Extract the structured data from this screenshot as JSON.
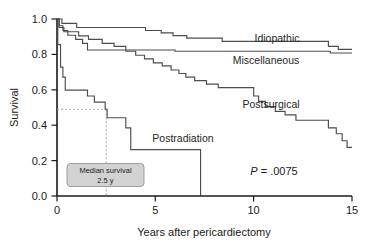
{
  "figure": {
    "background_color": "#ffffff",
    "curve_color": "#4d4d4d",
    "axis_color": "#1a1a1a",
    "annotation_fill": "#d2d2d2"
  },
  "axes": {
    "y_axis_title": "Survival",
    "x_axis_title": "Years after pericardiectomy",
    "y_ticks": [
      "0.0",
      "0.2",
      "0.4",
      "0.6",
      "0.8",
      "1.0"
    ],
    "x_ticks": [
      "0",
      "5",
      "10",
      "15"
    ]
  },
  "series_labels": {
    "idiopathic": "Idiopathic",
    "miscellaneous": "Miscellaneous",
    "postsurgical": "Postsurgical",
    "postradiation": "Postradiation"
  },
  "statistics": {
    "p_symbol": "P",
    "p_equals": " = .0075",
    "p_full": "P = .0075"
  },
  "annotation": {
    "line1": "Median survival",
    "line2": "2.5 y"
  },
  "chart_data": {
    "type": "line",
    "title": "",
    "subtitle": "",
    "xlabel": "Years after pericardiectomy",
    "ylabel": "Survival",
    "xlim": [
      0,
      15
    ],
    "ylim": [
      0.0,
      1.0
    ],
    "x_ticks": [
      0,
      5,
      10,
      15
    ],
    "y_ticks": [
      0.0,
      0.2,
      0.4,
      0.6,
      0.8,
      1.0
    ],
    "grid": false,
    "legend_position": "inline-labels",
    "curve_style": "kaplan-meier step",
    "annotations": [
      {
        "text": "P = .0075",
        "x": 11.1,
        "y": 0.175
      },
      {
        "text": "Median survival 2.5 y",
        "x": 2.45,
        "y": 0.135,
        "refers_to": "postradiation",
        "guide": "dashed lines from y=0.49 to x=2.45"
      },
      {
        "text": "Idiopathic",
        "x": 12.0,
        "y": 0.875
      },
      {
        "text": "Miscellaneous",
        "x": 10.6,
        "y": 0.745
      },
      {
        "text": "Postsurgical",
        "x": 10.6,
        "y": 0.505
      },
      {
        "text": "Postradiation",
        "x": 4.4,
        "y": 0.355
      }
    ],
    "median_survival": {
      "group": "Postradiation",
      "value_years": 2.5,
      "label": "2.5 y"
    },
    "p_value": 0.0075,
    "series": [
      {
        "name": "Idiopathic",
        "steps": [
          [
            0.0,
            1.0
          ],
          [
            0.25,
            1.0
          ],
          [
            0.25,
            0.975
          ],
          [
            1.0,
            0.975
          ],
          [
            1.0,
            0.952
          ],
          [
            4.5,
            0.952
          ],
          [
            4.5,
            0.935
          ],
          [
            5.3,
            0.935
          ],
          [
            5.3,
            0.922
          ],
          [
            5.9,
            0.922
          ],
          [
            5.9,
            0.906
          ],
          [
            6.6,
            0.906
          ],
          [
            6.6,
            0.892
          ],
          [
            8.4,
            0.892
          ],
          [
            8.4,
            0.874
          ],
          [
            13.8,
            0.874
          ],
          [
            13.8,
            0.845
          ],
          [
            14.3,
            0.845
          ],
          [
            14.3,
            0.828
          ],
          [
            15.0,
            0.828
          ]
        ]
      },
      {
        "name": "Miscellaneous",
        "steps": [
          [
            0.0,
            1.0
          ],
          [
            0.12,
            1.0
          ],
          [
            0.12,
            0.962
          ],
          [
            0.3,
            0.962
          ],
          [
            0.3,
            0.935
          ],
          [
            0.55,
            0.935
          ],
          [
            0.55,
            0.908
          ],
          [
            0.95,
            0.908
          ],
          [
            0.95,
            0.885
          ],
          [
            1.3,
            0.885
          ],
          [
            1.3,
            0.862
          ],
          [
            1.55,
            0.862
          ],
          [
            1.55,
            0.825
          ],
          [
            6.0,
            0.825
          ],
          [
            6.0,
            0.818
          ],
          [
            13.9,
            0.818
          ],
          [
            13.9,
            0.808
          ],
          [
            15.0,
            0.808
          ]
        ]
      },
      {
        "name": "Postsurgical",
        "steps": [
          [
            0.0,
            1.0
          ],
          [
            0.1,
            1.0
          ],
          [
            0.1,
            0.952
          ],
          [
            0.35,
            0.952
          ],
          [
            0.35,
            0.928
          ],
          [
            1.1,
            0.928
          ],
          [
            1.1,
            0.905
          ],
          [
            1.6,
            0.905
          ],
          [
            1.6,
            0.885
          ],
          [
            2.3,
            0.885
          ],
          [
            2.3,
            0.862
          ],
          [
            2.9,
            0.862
          ],
          [
            2.9,
            0.845
          ],
          [
            3.5,
            0.845
          ],
          [
            3.5,
            0.818
          ],
          [
            4.0,
            0.818
          ],
          [
            4.0,
            0.795
          ],
          [
            4.45,
            0.795
          ],
          [
            4.45,
            0.775
          ],
          [
            4.9,
            0.775
          ],
          [
            4.9,
            0.752
          ],
          [
            5.35,
            0.752
          ],
          [
            5.35,
            0.735
          ],
          [
            5.8,
            0.735
          ],
          [
            5.8,
            0.712
          ],
          [
            6.2,
            0.712
          ],
          [
            6.2,
            0.692
          ],
          [
            6.55,
            0.692
          ],
          [
            6.55,
            0.672
          ],
          [
            7.0,
            0.672
          ],
          [
            7.0,
            0.652
          ],
          [
            7.6,
            0.652
          ],
          [
            7.6,
            0.632
          ],
          [
            8.2,
            0.632
          ],
          [
            8.2,
            0.612
          ],
          [
            10.0,
            0.612
          ],
          [
            10.0,
            0.565
          ],
          [
            10.25,
            0.565
          ],
          [
            10.25,
            0.535
          ],
          [
            10.6,
            0.535
          ],
          [
            10.6,
            0.505
          ],
          [
            11.1,
            0.505
          ],
          [
            11.1,
            0.478
          ],
          [
            11.6,
            0.478
          ],
          [
            11.6,
            0.458
          ],
          [
            12.15,
            0.458
          ],
          [
            12.15,
            0.428
          ],
          [
            13.8,
            0.428
          ],
          [
            13.8,
            0.385
          ],
          [
            14.2,
            0.385
          ],
          [
            14.2,
            0.352
          ],
          [
            14.5,
            0.352
          ],
          [
            14.5,
            0.312
          ],
          [
            14.75,
            0.312
          ],
          [
            14.75,
            0.275
          ],
          [
            15.0,
            0.275
          ]
        ]
      },
      {
        "name": "Postradiation",
        "steps": [
          [
            0.0,
            1.0
          ],
          [
            0.04,
            1.0
          ],
          [
            0.04,
            0.855
          ],
          [
            0.18,
            0.855
          ],
          [
            0.18,
            0.728
          ],
          [
            0.3,
            0.728
          ],
          [
            0.3,
            0.672
          ],
          [
            0.42,
            0.672
          ],
          [
            0.42,
            0.598
          ],
          [
            1.55,
            0.598
          ],
          [
            1.55,
            0.565
          ],
          [
            1.9,
            0.565
          ],
          [
            1.9,
            0.53
          ],
          [
            2.45,
            0.53
          ],
          [
            2.45,
            0.49
          ],
          [
            2.55,
            0.49
          ],
          [
            2.55,
            0.442
          ],
          [
            3.5,
            0.442
          ],
          [
            3.5,
            0.385
          ],
          [
            3.75,
            0.385
          ],
          [
            3.75,
            0.262
          ],
          [
            7.3,
            0.262
          ],
          [
            7.3,
            0.0
          ]
        ]
      }
    ]
  }
}
